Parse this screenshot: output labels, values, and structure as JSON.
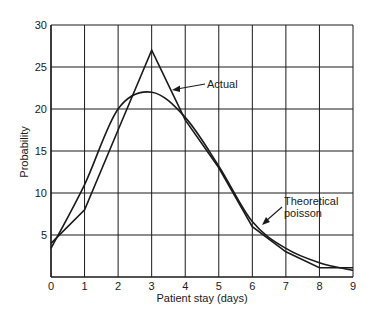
{
  "chart_data": {
    "type": "line",
    "title": "",
    "xlabel": "Patient stay (days)",
    "ylabel": "Probability",
    "xlim": [
      0,
      9
    ],
    "ylim": [
      0,
      30
    ],
    "x_ticks": [
      0,
      1,
      2,
      3,
      4,
      5,
      6,
      7,
      8,
      9
    ],
    "y_ticks": [
      5,
      10,
      15,
      20,
      25,
      30
    ],
    "grid": true,
    "legend": "none (inline annotations with arrows)",
    "x": [
      0,
      1,
      2,
      3,
      4,
      5,
      6,
      7,
      8,
      9
    ],
    "series": [
      {
        "name": "Actual",
        "style": "piecewise-linear",
        "values": [
          4.0,
          8.0,
          17.5,
          27.0,
          18.7,
          13.0,
          6.0,
          3.0,
          1.1,
          1.1
        ]
      },
      {
        "name": "Theoretical poisson",
        "style": "smooth",
        "values": [
          3.4,
          11.0,
          20.0,
          22.0,
          19.0,
          13.2,
          6.6,
          3.4,
          1.7,
          0.8
        ]
      }
    ],
    "annotations": [
      {
        "text": "Actual",
        "points_to_series": "Actual",
        "at_x": 3.6
      },
      {
        "text": "Theoretical poisson",
        "lines": [
          "Theoretical",
          "poisson"
        ],
        "points_to_series": "Theoretical poisson",
        "at_x": 6.2
      }
    ]
  },
  "labels": {
    "xlabel": "Patient stay (days)",
    "ylabel": "Probability",
    "annot_actual": "Actual",
    "annot_poisson_line1": "Theoretical",
    "annot_poisson_line2": "poisson"
  },
  "colors": {
    "line": "#1a1a1a",
    "grid": "#1a1a1a",
    "background": "#ffffff"
  }
}
